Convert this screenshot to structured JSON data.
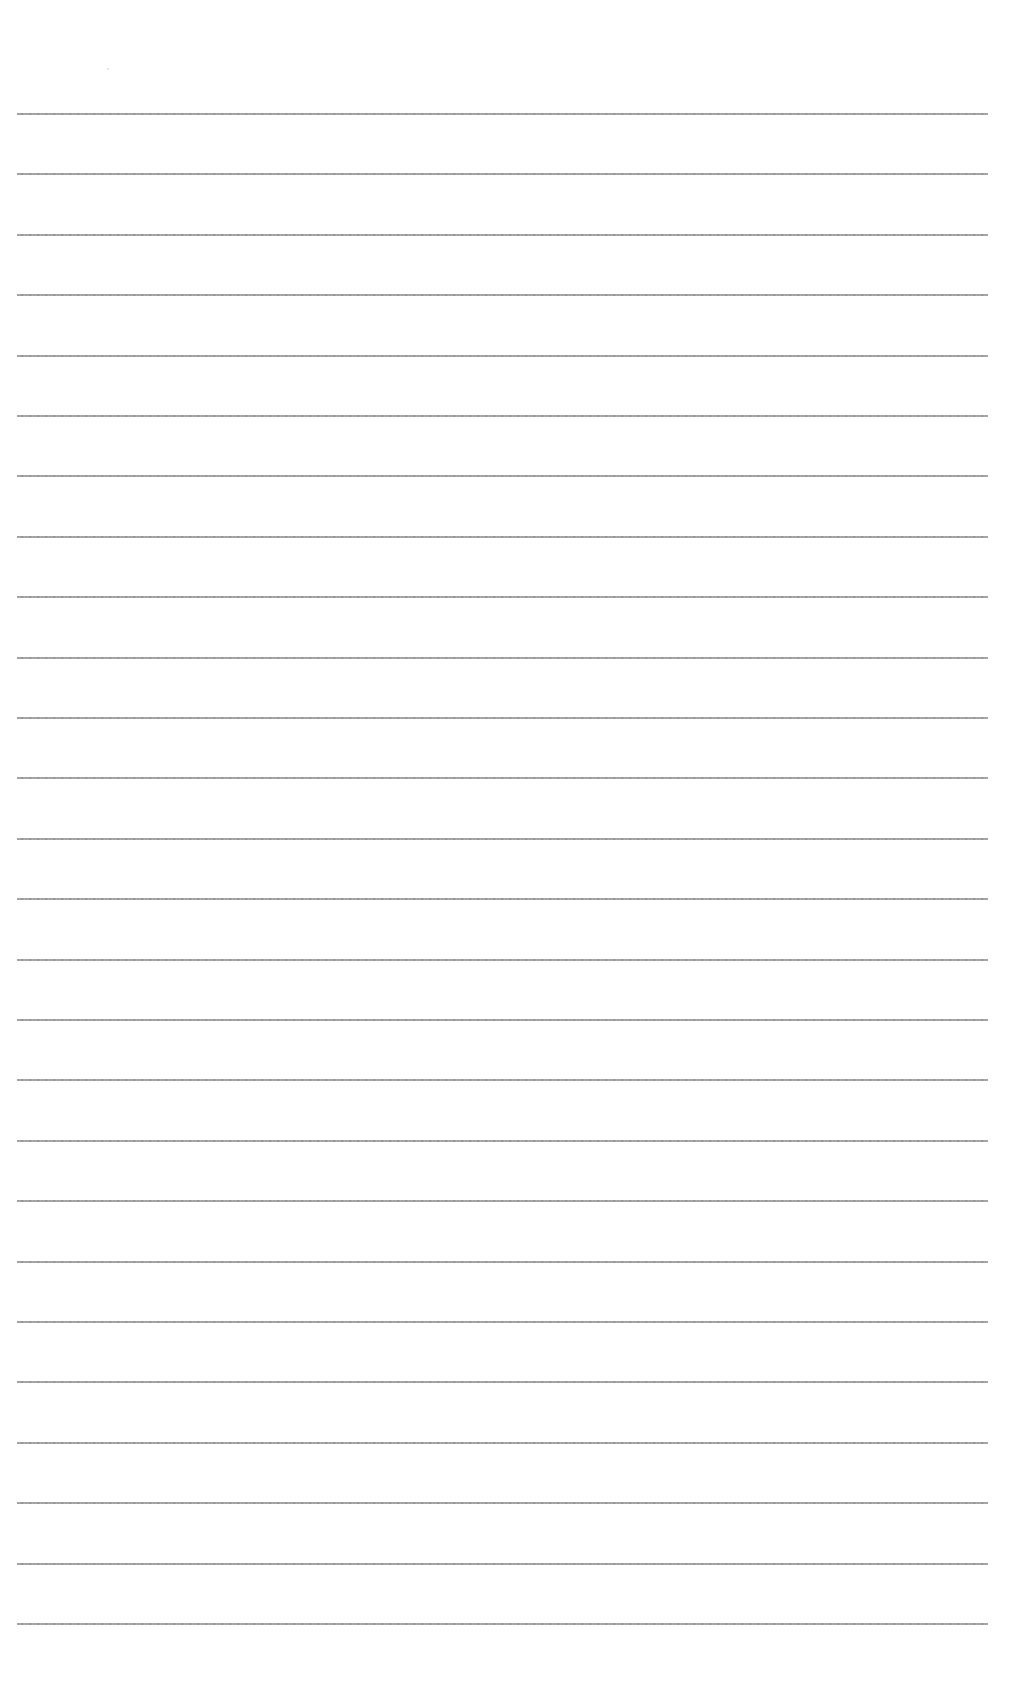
{
  "page": {
    "type": "blank lined paper",
    "background_color": "#ffffff",
    "rule_color": "#8c8c8c",
    "rule_count": 26,
    "rule_left_px": 17,
    "rule_right_px": 988,
    "rule_first_y_px": 113,
    "rule_spacing_px": 60.4,
    "text_content": ""
  }
}
